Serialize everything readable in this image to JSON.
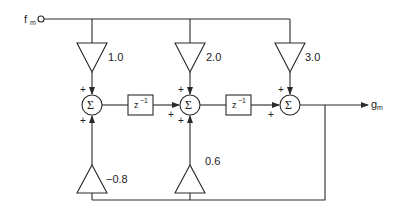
{
  "diagram": {
    "type": "signal-flow block diagram (IIR filter)",
    "input": {
      "label": "f",
      "subscript": "m"
    },
    "output": {
      "label": "g",
      "subscript": "m"
    },
    "feedforward_gains": [
      "1.0",
      "2.0",
      "3.0"
    ],
    "feedback_gains": [
      "−0.8",
      "0.6"
    ],
    "summer_symbol": "Σ",
    "delay": {
      "label": "z",
      "exponent": "−1"
    },
    "sign": "+",
    "colors": {
      "stroke": "#2a2a2a",
      "background": "#ffffff"
    }
  }
}
